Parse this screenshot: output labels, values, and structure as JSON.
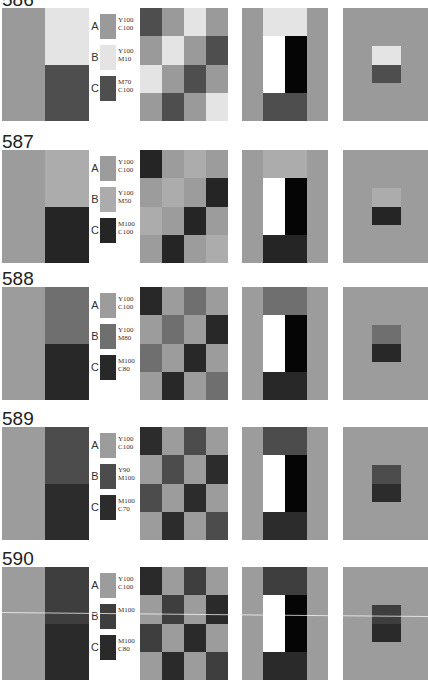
{
  "colors": {
    "white": "#ffffff",
    "black": "#050505"
  },
  "plates": [
    {
      "number": "586",
      "labels": [
        "A",
        "B",
        "C"
      ],
      "A": {
        "code": "Y100\nC100",
        "color": "#9a9a9a"
      },
      "B": {
        "code": "Y100\nM10",
        "color": "#e4e4e4"
      },
      "C": {
        "code": "M70\nC100",
        "color": "#4e4e4e"
      },
      "checker": [
        [
          "C",
          "A",
          "B",
          "A"
        ],
        [
          "A",
          "B",
          "A",
          "C"
        ],
        [
          "B",
          "A",
          "C",
          "A"
        ],
        [
          "A",
          "C",
          "A",
          "B"
        ]
      ]
    },
    {
      "number": "587",
      "labels": [
        "A",
        "B",
        "C"
      ],
      "A": {
        "code": "Y100\nC100",
        "color": "#9c9c9c"
      },
      "B": {
        "code": "Y100\nM50",
        "color": "#acacac"
      },
      "C": {
        "code": "M100\nC100",
        "color": "#252525"
      },
      "checker": [
        [
          "C",
          "A",
          "B",
          "A"
        ],
        [
          "A",
          "B",
          "A",
          "C"
        ],
        [
          "B",
          "A",
          "C",
          "A"
        ],
        [
          "A",
          "C",
          "A",
          "B"
        ]
      ]
    },
    {
      "number": "588",
      "labels": [
        "A",
        "B",
        "C"
      ],
      "A": {
        "code": "Y100\nC100",
        "color": "#9c9c9c"
      },
      "B": {
        "code": "Y100\nM80",
        "color": "#6f6f6f"
      },
      "C": {
        "code": "M100\nC80",
        "color": "#282828"
      },
      "checker": [
        [
          "C",
          "A",
          "B",
          "A"
        ],
        [
          "A",
          "B",
          "A",
          "C"
        ],
        [
          "B",
          "A",
          "C",
          "A"
        ],
        [
          "A",
          "C",
          "A",
          "B"
        ]
      ]
    },
    {
      "number": "589",
      "labels": [
        "A",
        "B",
        "C"
      ],
      "A": {
        "code": "Y100\nC100",
        "color": "#9c9c9c"
      },
      "B": {
        "code": "Y90\nM100",
        "color": "#4c4c4c"
      },
      "C": {
        "code": "M100\nC70",
        "color": "#2c2c2c"
      },
      "checker": [
        [
          "C",
          "A",
          "B",
          "A"
        ],
        [
          "A",
          "B",
          "A",
          "C"
        ],
        [
          "B",
          "A",
          "C",
          "A"
        ],
        [
          "A",
          "C",
          "A",
          "B"
        ]
      ]
    },
    {
      "number": "590",
      "labels": [
        "A",
        "B",
        "C"
      ],
      "A": {
        "code": "Y100\nC100",
        "color": "#9c9c9c"
      },
      "B": {
        "code": "M100",
        "color": "#3e3e3e"
      },
      "C": {
        "code": "M100\nC80",
        "color": "#2a2a2a"
      },
      "checker": [
        [
          "C",
          "A",
          "B",
          "A"
        ],
        [
          "A",
          "B",
          "A",
          "C"
        ],
        [
          "B",
          "A",
          "C",
          "A"
        ],
        [
          "A",
          "C",
          "A",
          "B"
        ]
      ]
    }
  ]
}
